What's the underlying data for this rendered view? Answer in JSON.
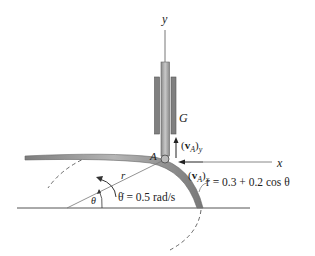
{
  "diagram": {
    "type": "kinematics-figure",
    "axes": {
      "y_label": "y",
      "x_label": "x"
    },
    "labels": {
      "collar": "G",
      "point": "A",
      "radius": "r",
      "angle": "θ",
      "velocity_y_vec": "v",
      "velocity_y_sub": "A",
      "velocity_y_axis": "y",
      "velocity_x_vec": "v",
      "velocity_x_sub": "A",
      "velocity_x_axis": "x",
      "angular_rate": "θ̇ = 0.5 rad/s",
      "cam_equation": "r = 0.3 + 0.2 cos θ"
    },
    "colors": {
      "line": "#555555",
      "rod": "#9a9a9a",
      "sleeve": "#7a7a7a",
      "cam": "#8c8c8c"
    }
  }
}
